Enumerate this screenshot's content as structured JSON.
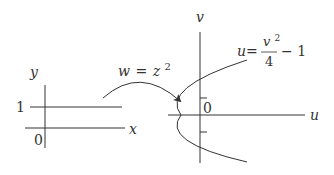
{
  "diagram": {
    "type": "conformal-mapping",
    "mapping_label": {
      "w": "w",
      "eq": "=",
      "z": "z",
      "exp": "2"
    },
    "z_plane": {
      "x_axis_label": "x",
      "y_axis_label": "y",
      "origin_label": "0",
      "line_label": "1",
      "line_description": "horizontal line y = 1"
    },
    "w_plane": {
      "u_axis_label": "u",
      "v_axis_label": "v",
      "origin_label": "0",
      "curve_equation": {
        "lhs": "u",
        "eq": "=",
        "num": "v",
        "num_exp": "2",
        "den": "4",
        "tail": "− 1"
      },
      "curve_description": "parabola u = v^2/4 - 1"
    },
    "colors": {
      "stroke": "#333333",
      "background": "#ffffff"
    }
  }
}
